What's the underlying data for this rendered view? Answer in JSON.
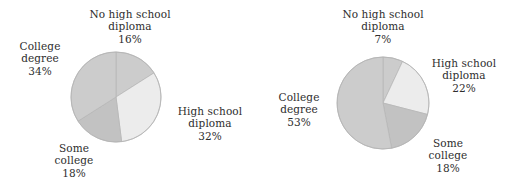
{
  "figure": {
    "background": "#ffffff",
    "panels": [
      "left",
      "right"
    ]
  },
  "palette": {
    "slice_medium_gray": "#cccccc",
    "slice_dark_gray": "#c2c2c2",
    "slice_light_gray": "#ececec",
    "slice_edge": "#b4b4b4",
    "text": "#2e2e2e"
  },
  "chart_data": [
    {
      "type": "pie",
      "title": "",
      "panel": "left",
      "center": [
        116,
        97
      ],
      "radius": 45,
      "start_angle_deg": 0,
      "direction": "clockwise",
      "labels_outside": true,
      "categories": [
        "No high school diploma",
        "High school diploma",
        "Some college",
        "College degree"
      ],
      "values": [
        16,
        32,
        18,
        34
      ],
      "unit": "%",
      "slices": [
        {
          "name": "No high school diploma",
          "value": 16,
          "value_label": "16%",
          "name_line1": "No high school",
          "name_line2": "diploma",
          "color": "#cccccc"
        },
        {
          "name": "High school diploma",
          "value": 32,
          "value_label": "32%",
          "name_line1": "High school",
          "name_line2": "diploma",
          "color": "#ececec"
        },
        {
          "name": "Some college",
          "value": 18,
          "value_label": "18%",
          "name_line1": "Some",
          "name_line2": "college",
          "color": "#c2c2c2"
        },
        {
          "name": "College degree",
          "value": 34,
          "value_label": "34%",
          "name_line1": "College",
          "name_line2": "degree",
          "color": "#cccccc"
        }
      ]
    },
    {
      "type": "pie",
      "title": "",
      "panel": "right",
      "center": [
        128,
        103
      ],
      "radius": 46,
      "start_angle_deg": 0,
      "direction": "clockwise",
      "labels_outside": true,
      "categories": [
        "No high school diploma",
        "High school diploma",
        "Some college",
        "College degree"
      ],
      "values": [
        7,
        22,
        18,
        53
      ],
      "unit": "%",
      "slices": [
        {
          "name": "No high school diploma",
          "value": 7,
          "value_label": "7%",
          "name_line1": "No high school",
          "name_line2": "diploma",
          "color": "#cccccc"
        },
        {
          "name": "High school diploma",
          "value": 22,
          "value_label": "22%",
          "name_line1": "High school",
          "name_line2": "diploma",
          "color": "#ececec"
        },
        {
          "name": "Some college",
          "value": 18,
          "value_label": "18%",
          "name_line1": "Some",
          "name_line2": "college",
          "color": "#c2c2c2"
        },
        {
          "name": "College degree",
          "value": 53,
          "value_label": "53%",
          "name_line1": "College",
          "name_line2": "degree",
          "color": "#cccccc"
        }
      ]
    }
  ]
}
